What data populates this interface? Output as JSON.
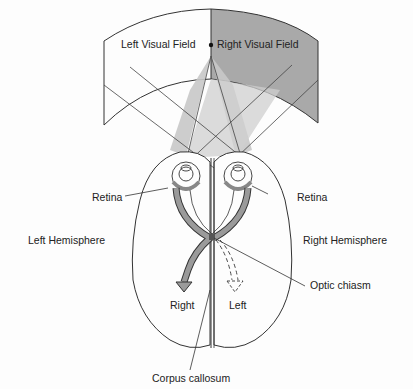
{
  "diagram": {
    "labels": {
      "left_visual_field": "Left Visual Field",
      "right_visual_field": "Right Visual Field",
      "retina_left": "Retina",
      "retina_right": "Retina",
      "left_hemisphere": "Left Hemisphere",
      "right_hemisphere": "Right Hemisphere",
      "optic_chiasm": "Optic chiasm",
      "arrow_right": "Right",
      "arrow_left": "Left",
      "corpus_callosum": "Corpus callosum"
    },
    "colors": {
      "right_field_fill": "#a9a9a9",
      "projection_fill": "#c8c8c8",
      "pathway_fill": "#9a9a9a",
      "outline": "#333333",
      "background": "#fdfdfd"
    }
  }
}
